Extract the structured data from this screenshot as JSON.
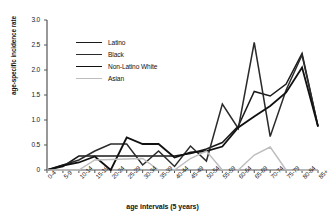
{
  "chart_data": {
    "type": "line",
    "title": "",
    "xlabel": "age intervals (5 years)",
    "ylabel": "age-specific incidence rate",
    "ylim": [
      0,
      3.0
    ],
    "yticks": [
      "0",
      "0.5",
      "1.0",
      "1.5",
      "2.0",
      "2.5",
      "3.0"
    ],
    "ytick_values": [
      0,
      0.5,
      1.0,
      1.5,
      2.0,
      2.5,
      3.0
    ],
    "grid": false,
    "legend_position": "upper-left-inside",
    "categories": [
      "0-4",
      "5-9",
      "10-14",
      "15-19",
      "20-24",
      "25-29",
      "30-34",
      "35-39",
      "40-44",
      "45-49",
      "50-54",
      "55-59",
      "60-64",
      "65-69",
      "70-74",
      "75-79",
      "80-84",
      "85+"
    ],
    "series": [
      {
        "name": "Latino",
        "color": "#1a1a1a",
        "width": 1.5,
        "values": [
          0,
          0.07,
          0.28,
          0.28,
          0.28,
          0.28,
          0.28,
          0.28,
          0.28,
          0.33,
          0.42,
          0.55,
          0.88,
          1.57,
          1.48,
          1.72,
          2.33,
          0.87
        ]
      },
      {
        "name": "Black",
        "color": "#2b2b2b",
        "width": 1.5,
        "values": [
          0,
          0.1,
          0.2,
          0.38,
          0.52,
          0.52,
          0.1,
          0.38,
          0.07,
          0.48,
          0.18,
          1.32,
          0.83,
          2.55,
          0.67,
          1.6,
          2.3,
          0.87
        ]
      },
      {
        "name": "Non-Latino White",
        "color": "#111111",
        "width": 1.8,
        "values": [
          0,
          0.09,
          0.15,
          0.27,
          0.0,
          0.65,
          0.52,
          0.52,
          0.25,
          0.35,
          0.38,
          0.47,
          0.85,
          1.07,
          1.28,
          1.55,
          2.05,
          0.87
        ]
      },
      {
        "name": "Asian",
        "color": "#bdbdbd",
        "width": 1.4,
        "values": [
          0,
          0,
          0,
          0.2,
          0.21,
          0.22,
          0.23,
          0,
          0,
          0.23,
          0.38,
          0,
          0,
          0.3,
          0.46,
          0,
          0,
          0
        ]
      }
    ]
  },
  "legend": {
    "items": [
      {
        "label": "Latino"
      },
      {
        "label": "Black"
      },
      {
        "label": "Non-Latino White"
      },
      {
        "label": "Asian"
      }
    ]
  }
}
